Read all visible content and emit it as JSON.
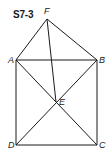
{
  "figure": {
    "title": "S7-3",
    "points": {
      "A": {
        "label": "A",
        "x": 16,
        "y": 60
      },
      "B": {
        "label": "B",
        "x": 97,
        "y": 60
      },
      "C": {
        "label": "C",
        "x": 97,
        "y": 145
      },
      "D": {
        "label": "D",
        "x": 16,
        "y": 145
      },
      "E": {
        "label": "E",
        "x": 56,
        "y": 102
      },
      "F": {
        "label": "F",
        "x": 47,
        "y": 19
      }
    },
    "segments": [
      [
        "A",
        "B"
      ],
      [
        "B",
        "C"
      ],
      [
        "C",
        "D"
      ],
      [
        "D",
        "A"
      ],
      [
        "A",
        "C"
      ],
      [
        "B",
        "D"
      ],
      [
        "F",
        "A"
      ],
      [
        "F",
        "B"
      ],
      [
        "F",
        "E"
      ]
    ],
    "stroke_color": "#1a1a1a"
  }
}
